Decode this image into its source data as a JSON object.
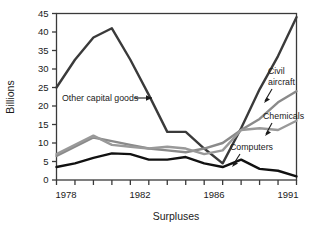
{
  "chart_data": {
    "type": "line",
    "title": "",
    "xlabel": "Surpluses",
    "ylabel": "Billions",
    "xlim": [
      1978,
      1991
    ],
    "ylim": [
      0,
      45
    ],
    "grid": false,
    "legend_position": "inline-annotations",
    "x": [
      1978,
      1979,
      1980,
      1981,
      1982,
      1983,
      1984,
      1985,
      1986,
      1987,
      1988,
      1989,
      1990,
      1991
    ],
    "y_ticks": [
      0,
      5,
      10,
      15,
      20,
      25,
      30,
      35,
      40,
      45
    ],
    "x_ticks": [
      1978,
      1979,
      1980,
      1981,
      1982,
      1983,
      1984,
      1985,
      1986,
      1987,
      1988,
      1989,
      1990,
      1991
    ],
    "x_tick_labels_shown": [
      "1978",
      "1982",
      "1986",
      "1991"
    ],
    "series": [
      {
        "name": "Other capital goods",
        "color": "#3a3a3a",
        "values": [
          25.0,
          32.5,
          38.5,
          41.0,
          32.5,
          23.0,
          13.0,
          13.0,
          8.5,
          4.5,
          14.0,
          24.5,
          33.5,
          44.0
        ]
      },
      {
        "name": "Civil aircraft",
        "color": "#8a8a8a",
        "values": [
          6.5,
          9.0,
          11.5,
          10.5,
          9.5,
          8.5,
          8.0,
          7.5,
          8.5,
          10.0,
          13.5,
          16.5,
          21.0,
          24.0
        ]
      },
      {
        "name": "Chemicals",
        "color": "#999999",
        "values": [
          7.0,
          9.5,
          12.0,
          9.5,
          9.0,
          8.5,
          9.0,
          8.5,
          7.0,
          8.0,
          13.5,
          14.0,
          13.5,
          16.0
        ]
      },
      {
        "name": "Computers",
        "color": "#111111",
        "values": [
          3.5,
          4.5,
          6.0,
          7.2,
          7.0,
          5.5,
          5.5,
          6.2,
          4.5,
          3.5,
          5.5,
          3.0,
          2.5,
          1.0
        ]
      }
    ],
    "annotations": [
      {
        "name": "other-capital-goods",
        "text": "Other capital goods",
        "arrow": "right"
      },
      {
        "name": "civil-aircraft",
        "text_line1": "Civil",
        "text_line2": "aircraft",
        "arrow": "down-left"
      },
      {
        "name": "chemicals",
        "text": "Chemicals",
        "arrow": "down-left"
      },
      {
        "name": "computers",
        "text": "Computers",
        "arrow": "down-left"
      }
    ]
  },
  "labels": {
    "ylabel": "Billions",
    "xlabel": "Surpluses",
    "y_ticks": [
      "0",
      "5",
      "10",
      "15",
      "20",
      "25",
      "30",
      "35",
      "40",
      "45"
    ],
    "x_1978": "1978",
    "x_1982": "1982",
    "x_1986": "1986",
    "x_1991": "1991",
    "annot_other": "Other capital goods",
    "annot_civil_1": "Civil",
    "annot_civil_2": "aircraft",
    "annot_chem": "Chemicals",
    "annot_comp": "Computers"
  },
  "colors": {
    "frame": "#3a3a3a",
    "other_capital_goods": "#3a3a3a",
    "civil_aircraft": "#8a8a8a",
    "chemicals": "#999999",
    "computers": "#111111",
    "background": "#ffffff"
  }
}
